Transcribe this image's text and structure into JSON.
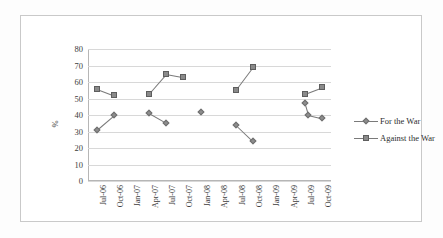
{
  "chart_data": {
    "type": "scatter",
    "title": "",
    "xlabel": "",
    "ylabel": "%",
    "ylim": [
      0,
      80
    ],
    "ytick_step": 10,
    "yticks": [
      "80",
      "70",
      "60",
      "50",
      "40",
      "30",
      "20",
      "10",
      "0"
    ],
    "grid": true,
    "legend_position": "right",
    "categories": [
      "Jul-06",
      "Oct-06",
      "Jan-07",
      "Apr-07",
      "Jul-07",
      "Oct-07",
      "Jan-08",
      "Apr-08",
      "Jul-08",
      "Oct-08",
      "Jan-09",
      "Apr-09",
      "Jul-09",
      "Oct-09"
    ],
    "series": [
      {
        "name": "For the War",
        "marker": "diamond",
        "color": "#8d8d8d",
        "values": [
          31,
          40,
          null,
          41,
          35,
          null,
          42,
          null,
          34,
          24,
          null,
          null,
          47,
          38
        ],
        "extra_points": [
          {
            "category": "Jul-09",
            "value": 40
          }
        ]
      },
      {
        "name": "Against the War",
        "marker": "square",
        "color": "#8a8a8a",
        "values": [
          56,
          52,
          null,
          53,
          65,
          63,
          null,
          null,
          55,
          69,
          null,
          null,
          53,
          57
        ],
        "extra_points": []
      }
    ]
  },
  "legend": {
    "items": [
      {
        "label": "For the War",
        "marker": "diamond"
      },
      {
        "label": "Against the War",
        "marker": "square"
      }
    ]
  },
  "axes": {
    "y_title": "%"
  }
}
